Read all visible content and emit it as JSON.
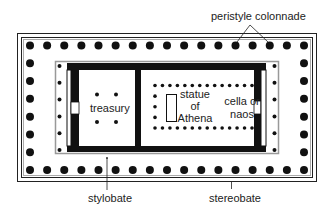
{
  "diagram": {
    "colors": {
      "ink": "#111111",
      "border_gray": "#999999",
      "background": "#ffffff"
    },
    "labels": {
      "peristyle": "peristyle colonnade",
      "treasury": "treasury",
      "statue_line1": "statue",
      "statue_line2": "of",
      "statue_line3": "Athena",
      "cella_line1": "cella or",
      "cella_line2": "naos",
      "stylobate": "stylobate",
      "stereobate": "stereobate"
    },
    "outer_colonnade": {
      "columns_long_side": 17,
      "columns_short_side": 8
    },
    "porch_columns_per_end": 6,
    "treasury_columns": 4,
    "cella_inner_colonnade": {
      "top_row": 14,
      "bottom_row": 14,
      "back_column": 3
    }
  }
}
